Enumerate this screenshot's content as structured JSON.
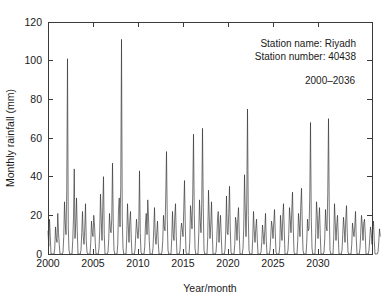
{
  "chart_data": {
    "type": "line",
    "title": "",
    "xlabel": "Year/month",
    "ylabel": "Monthly rainfall (mm)",
    "xlim": [
      2000,
      2036
    ],
    "ylim": [
      0,
      120
    ],
    "grid": false,
    "legend_position": "none",
    "x_ticks": [
      2000,
      2005,
      2010,
      2015,
      2020,
      2025,
      2030
    ],
    "x_tick_labels": [
      "2000",
      "2005",
      "2010",
      "2015",
      "2020",
      "2025",
      "2030"
    ],
    "y_ticks": [
      0,
      20,
      40,
      60,
      80,
      100,
      120
    ],
    "y_tick_labels": [
      "0",
      "20",
      "40",
      "60",
      "80",
      "100",
      "120"
    ],
    "annotations": [
      {
        "id": "station-name",
        "text": "Station name: Riyadh"
      },
      {
        "id": "station-number",
        "text": "Station number: 40438"
      },
      {
        "id": "period",
        "text": "2000–2036"
      }
    ],
    "series": [
      {
        "name": "Monthly rainfall",
        "units": "mm",
        "x_start_year": 2000,
        "x_step_months": 1,
        "values": [
          12,
          4,
          18,
          9,
          0,
          0,
          0,
          0,
          0,
          3,
          14,
          8,
          6,
          21,
          11,
          5,
          0,
          0,
          0,
          0,
          1,
          9,
          27,
          16,
          10,
          33,
          101,
          14,
          2,
          0,
          0,
          0,
          0,
          7,
          19,
          44,
          8,
          16,
          29,
          12,
          0,
          0,
          0,
          0,
          2,
          11,
          22,
          9,
          5,
          13,
          26,
          7,
          1,
          0,
          0,
          0,
          0,
          6,
          17,
          11,
          9,
          20,
          15,
          6,
          0,
          0,
          0,
          0,
          3,
          12,
          31,
          18,
          7,
          24,
          40,
          10,
          0,
          0,
          0,
          0,
          1,
          8,
          21,
          13,
          11,
          18,
          47,
          16,
          2,
          0,
          0,
          0,
          0,
          5,
          23,
          29,
          14,
          35,
          111,
          19,
          3,
          0,
          0,
          0,
          0,
          9,
          26,
          15,
          6,
          17,
          22,
          8,
          0,
          0,
          0,
          0,
          2,
          10,
          18,
          12,
          8,
          14,
          43,
          11,
          1,
          0,
          0,
          0,
          0,
          4,
          16,
          21,
          10,
          28,
          19,
          7,
          0,
          0,
          0,
          0,
          3,
          13,
          24,
          9,
          5,
          11,
          17,
          6,
          0,
          0,
          0,
          0,
          1,
          7,
          20,
          14,
          12,
          30,
          53,
          18,
          2,
          0,
          0,
          0,
          0,
          8,
          22,
          10,
          7,
          19,
          26,
          9,
          0,
          0,
          0,
          0,
          2,
          11,
          16,
          13,
          9,
          23,
          38,
          15,
          1,
          0,
          0,
          0,
          0,
          6,
          25,
          20,
          13,
          31,
          62,
          21,
          3,
          0,
          0,
          0,
          0,
          10,
          28,
          17,
          11,
          26,
          65,
          24,
          2,
          0,
          0,
          0,
          0,
          9,
          33,
          19,
          8,
          15,
          27,
          12,
          0,
          0,
          0,
          0,
          1,
          7,
          18,
          22,
          6,
          14,
          20,
          9,
          0,
          0,
          0,
          0,
          2,
          12,
          30,
          11,
          10,
          21,
          35,
          13,
          1,
          0,
          0,
          0,
          0,
          5,
          19,
          16,
          7,
          18,
          24,
          10,
          0,
          0,
          0,
          0,
          3,
          14,
          41,
          23,
          9,
          27,
          75,
          20,
          2,
          0,
          0,
          0,
          0,
          8,
          22,
          12,
          6,
          13,
          18,
          8,
          0,
          0,
          0,
          0,
          1,
          6,
          15,
          10,
          5,
          12,
          21,
          7,
          0,
          0,
          0,
          0,
          2,
          9,
          17,
          14,
          8,
          16,
          23,
          11,
          1,
          0,
          0,
          0,
          0,
          4,
          20,
          13,
          7,
          19,
          26,
          12,
          0,
          0,
          0,
          0,
          2,
          10,
          24,
          18,
          11,
          22,
          32,
          14,
          1,
          0,
          0,
          0,
          0,
          7,
          21,
          15,
          9,
          25,
          34,
          16,
          2,
          0,
          0,
          0,
          0,
          6,
          18,
          12,
          13,
          29,
          68,
          19,
          3,
          0,
          0,
          0,
          0,
          11,
          27,
          20,
          8,
          17,
          24,
          10,
          0,
          0,
          0,
          0,
          1,
          8,
          23,
          14,
          12,
          31,
          70,
          22,
          2,
          0,
          0,
          0,
          0,
          9,
          26,
          16,
          7,
          15,
          20,
          9,
          0,
          0,
          0,
          0,
          2,
          10,
          19,
          13,
          6,
          18,
          25,
          11,
          1,
          0,
          0,
          0,
          0,
          5,
          16,
          12,
          9,
          14,
          22,
          8,
          0,
          0,
          0,
          0,
          3,
          11,
          20,
          15,
          7,
          16,
          18,
          10,
          0,
          0,
          0,
          0,
          2,
          8,
          14,
          11,
          5,
          12,
          17,
          7,
          0,
          0,
          0,
          0,
          1,
          6,
          13,
          9
        ]
      }
    ]
  }
}
